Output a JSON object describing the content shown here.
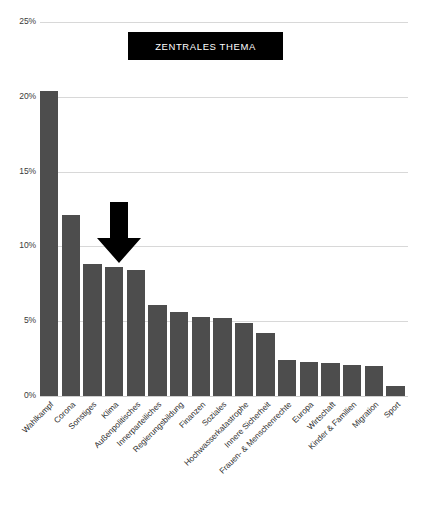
{
  "title": {
    "text": "ZENTRALES THEMA",
    "box_color": "#000000",
    "text_color": "#ffffff"
  },
  "annotation": {
    "name": "down-arrow",
    "points_at": "Klima",
    "color": "#000000"
  },
  "axis": {
    "y_ticks": [
      "0%",
      "5%",
      "10%",
      "15%",
      "20%",
      "25%"
    ],
    "y_tick_values": [
      0,
      5,
      10,
      15,
      20,
      25
    ]
  },
  "style": {
    "bar_color": "#4d4d4d",
    "grid_color": "#d8d8d8",
    "background": "#ffffff"
  },
  "chart_data": {
    "type": "bar",
    "title": "ZENTRALES THEMA",
    "xlabel": "",
    "ylabel": "",
    "ylim": [
      0,
      25
    ],
    "yticks": [
      0,
      5,
      10,
      15,
      20,
      25
    ],
    "ytick_labels": [
      "0%",
      "5%",
      "10%",
      "15%",
      "20%",
      "25%"
    ],
    "grid": true,
    "legend": "none",
    "categories": [
      "Wahlkampf",
      "Corona",
      "Sonstiges",
      "Klima",
      "Außenpolitisches",
      "Innerparteiliches",
      "Regierungsbildung",
      "Finanzen",
      "Soziales",
      "Hochwasserkatastrophe",
      "Innere Sicherheit",
      "Frauen- & Menschenrechte",
      "Europa",
      "Wirtschaft",
      "Kinder & Familien",
      "Migration",
      "Sport"
    ],
    "values": [
      20.4,
      12.1,
      8.8,
      8.6,
      8.4,
      6.1,
      5.6,
      5.3,
      5.2,
      4.9,
      4.2,
      2.4,
      2.3,
      2.2,
      2.1,
      2.0,
      0.7
    ],
    "units": "percent",
    "annotations": [
      {
        "type": "arrow",
        "direction": "down",
        "target_category": "Klima"
      }
    ]
  }
}
